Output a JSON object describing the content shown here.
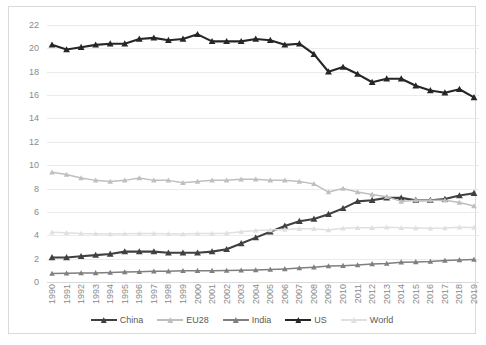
{
  "chart_data": {
    "type": "line",
    "title": "",
    "subtitle": "",
    "xlabel": "",
    "ylabel": "",
    "ylim": [
      0,
      22
    ],
    "yticks": [
      0,
      2,
      4,
      6,
      8,
      10,
      12,
      14,
      16,
      18,
      20,
      22
    ],
    "grid": true,
    "legend_position": "bottom",
    "categories": [
      "1990",
      "1991",
      "1992",
      "1993",
      "1994",
      "1995",
      "1996",
      "1997",
      "1998",
      "1999",
      "2000",
      "2001",
      "2002",
      "2003",
      "2004",
      "2005",
      "2006",
      "2007",
      "2008",
      "2009",
      "2010",
      "2011",
      "2012",
      "2013",
      "2014",
      "2015",
      "2016",
      "2017",
      "2018",
      "2019"
    ],
    "series": [
      {
        "name": "China",
        "color": "#404040",
        "values": [
          2.1,
          2.1,
          2.2,
          2.3,
          2.4,
          2.6,
          2.6,
          2.6,
          2.5,
          2.5,
          2.5,
          2.6,
          2.8,
          3.3,
          3.8,
          4.3,
          4.8,
          5.2,
          5.4,
          5.8,
          6.3,
          6.9,
          7.0,
          7.2,
          7.2,
          7.0,
          7.0,
          7.1,
          7.4,
          7.6
        ]
      },
      {
        "name": "EU28",
        "color": "#bfbfbf",
        "values": [
          9.4,
          9.2,
          8.9,
          8.7,
          8.6,
          8.7,
          8.9,
          8.7,
          8.7,
          8.5,
          8.6,
          8.7,
          8.7,
          8.8,
          8.8,
          8.7,
          8.7,
          8.6,
          8.4,
          7.7,
          8.0,
          7.7,
          7.5,
          7.3,
          6.9,
          7.0,
          7.0,
          7.0,
          6.8,
          6.5
        ]
      },
      {
        "name": "India",
        "color": "#7f7f7f",
        "values": [
          0.72,
          0.75,
          0.77,
          0.78,
          0.81,
          0.85,
          0.88,
          0.91,
          0.92,
          0.96,
          0.97,
          0.97,
          0.99,
          1.0,
          1.03,
          1.07,
          1.12,
          1.19,
          1.27,
          1.37,
          1.4,
          1.45,
          1.55,
          1.58,
          1.7,
          1.72,
          1.76,
          1.83,
          1.89,
          1.92
        ]
      },
      {
        "name": "US",
        "color": "#262626",
        "values": [
          20.3,
          19.9,
          20.1,
          20.3,
          20.4,
          20.4,
          20.8,
          20.9,
          20.7,
          20.8,
          21.2,
          20.6,
          20.6,
          20.6,
          20.8,
          20.7,
          20.3,
          20.4,
          19.5,
          18.0,
          18.4,
          17.8,
          17.1,
          17.4,
          17.4,
          16.8,
          16.4,
          16.2,
          16.5,
          15.8
        ]
      },
      {
        "name": "World",
        "color": "#e0e0e0",
        "values": [
          4.25,
          4.22,
          4.15,
          4.12,
          4.1,
          4.12,
          4.15,
          4.15,
          4.12,
          4.1,
          4.15,
          4.15,
          4.18,
          4.3,
          4.4,
          4.45,
          4.5,
          4.55,
          4.55,
          4.45,
          4.6,
          4.65,
          4.65,
          4.68,
          4.65,
          4.62,
          4.6,
          4.62,
          4.68,
          4.66
        ]
      }
    ]
  },
  "legend": {
    "items": [
      {
        "label": "China"
      },
      {
        "label": "EU28"
      },
      {
        "label": "India"
      },
      {
        "label": "US"
      },
      {
        "label": "World"
      }
    ]
  }
}
